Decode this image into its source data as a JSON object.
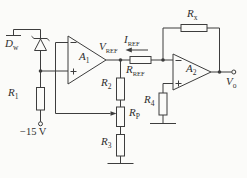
{
  "figure_type": "op-amp voltage/current reference circuit schematic",
  "colors": {
    "background": "#fbfbf9",
    "line": "#3d3d3d",
    "text": "#2e2e2e"
  },
  "labels": {
    "dw": {
      "main": "D",
      "sub": "w"
    },
    "r1": {
      "main": "R",
      "sub": "1"
    },
    "neg_supply": {
      "text": "−15 V"
    },
    "a1": {
      "main": "A",
      "sub": "1"
    },
    "vref": {
      "main": "V",
      "sub": "REF"
    },
    "iref": {
      "main": "I",
      "sub": "REF"
    },
    "rref": {
      "main": "R",
      "sub": "REF"
    },
    "r2": {
      "main": "R",
      "sub": "2"
    },
    "rp": {
      "main": "R",
      "sub": "P"
    },
    "r3": {
      "main": "R",
      "sub": "3"
    },
    "rx": {
      "main": "R",
      "sub": "x"
    },
    "a2": {
      "main": "A",
      "sub": "2"
    },
    "r4": {
      "main": "R",
      "sub": "4"
    },
    "vo": {
      "main": "V",
      "sub": "o"
    }
  },
  "components": [
    {
      "ref": "Dw",
      "type": "zener-diode",
      "connection": "cathode to ground, anode to A1 + input node"
    },
    {
      "ref": "R1",
      "type": "resistor",
      "connection": "zener node to −15 V supply"
    },
    {
      "ref": "A1",
      "type": "op-amp",
      "inputs": "− top, + bottom",
      "output": "VREF node"
    },
    {
      "ref": "R2",
      "type": "resistor",
      "connection": "VREF node to RP"
    },
    {
      "ref": "RP",
      "type": "potentiometer",
      "connection": "wiper feeds back to A1 − input"
    },
    {
      "ref": "R3",
      "type": "resistor",
      "connection": "RP to ground"
    },
    {
      "ref": "RREF",
      "type": "resistor",
      "connection": "VREF node to A2 − input, carries IREF (arrow pointing left)"
    },
    {
      "ref": "Rx",
      "type": "resistor",
      "connection": "feedback from A2 − input to output Vo"
    },
    {
      "ref": "A2",
      "type": "op-amp",
      "inputs": "− top, + bottom",
      "output": "Vo terminal"
    },
    {
      "ref": "R4",
      "type": "resistor",
      "connection": "A2 + input to ground"
    }
  ]
}
